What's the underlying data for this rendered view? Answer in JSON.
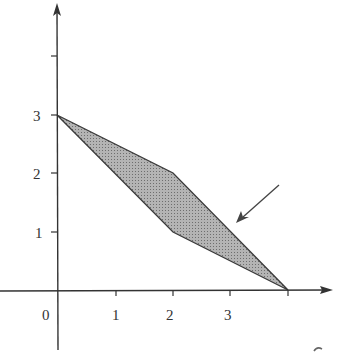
{
  "diagram": {
    "colors": {
      "axis": "#333333",
      "fill": "#a8a8a8",
      "edge": "#3a3a3a",
      "background": "#ffffff"
    },
    "origin_label": "0",
    "x_ticks": [
      {
        "label": "1",
        "value": 1
      },
      {
        "label": "2",
        "value": 2
      },
      {
        "label": "3",
        "value": 3
      }
    ],
    "y_ticks": [
      {
        "label": "1",
        "value": 1
      },
      {
        "label": "2",
        "value": 2
      },
      {
        "label": "3",
        "value": 3
      }
    ],
    "region_vertices": [
      [
        0,
        3
      ],
      [
        2,
        2
      ],
      [
        4,
        0
      ],
      [
        2,
        1
      ]
    ],
    "pointer_arrow": {
      "from": [
        279,
        185
      ],
      "to": [
        237,
        222
      ]
    }
  }
}
